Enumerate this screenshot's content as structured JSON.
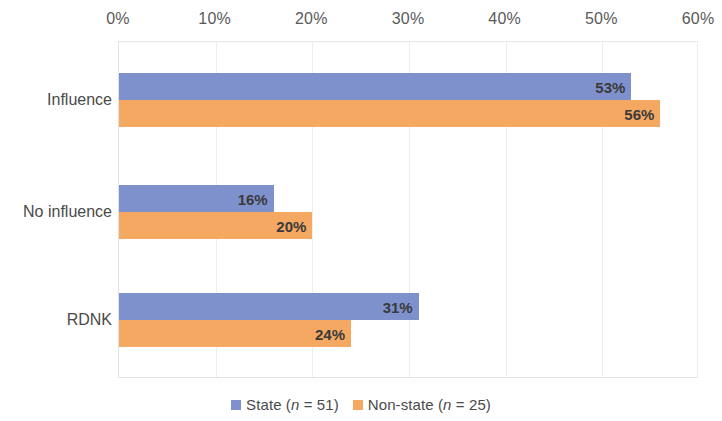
{
  "chart_data": {
    "type": "bar",
    "orientation": "horizontal",
    "title": "",
    "xlabel": "",
    "ylabel": "",
    "xlim": [
      0,
      60
    ],
    "xunit": "%",
    "grid": true,
    "legend_position": "bottom",
    "categories": [
      "Influence",
      "No influence",
      "RDNK"
    ],
    "xticks": [
      "0%",
      "10%",
      "20%",
      "30%",
      "40%",
      "50%",
      "60%"
    ],
    "xtick_values": [
      0,
      10,
      20,
      30,
      40,
      50,
      60
    ],
    "series": [
      {
        "name": "State (n = 51)",
        "legend_prefix": "State (",
        "legend_italic": "n",
        "legend_suffix": " = 51)",
        "color": "#7e91cd",
        "values": [
          53,
          16,
          31
        ],
        "labels": [
          "53%",
          "16%",
          "31%"
        ]
      },
      {
        "name": "Non-state (n = 25)",
        "legend_prefix": "Non-state (",
        "legend_italic": "n",
        "legend_suffix": " = 25)",
        "color": "#f5a862",
        "values": [
          56,
          20,
          24
        ],
        "labels": [
          "56%",
          "20%",
          "24%"
        ]
      }
    ]
  },
  "colors": {
    "state": "#7e91cd",
    "nonstate": "#f5a862",
    "gridline": "#ededed",
    "text": "#4a4a4a"
  }
}
